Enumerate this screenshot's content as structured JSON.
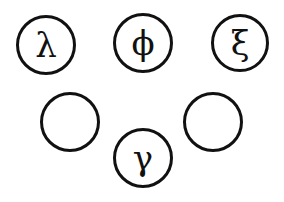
{
  "diagram": {
    "nodes": [
      {
        "id": "n1",
        "label": "λ",
        "cx": 46,
        "cy": 45,
        "r": 30
      },
      {
        "id": "n2",
        "label": "ϕ",
        "cx": 143,
        "cy": 43,
        "r": 30
      },
      {
        "id": "n3",
        "label": "ξ",
        "cx": 240,
        "cy": 43,
        "r": 29
      },
      {
        "id": "n4",
        "label": "",
        "cx": 70,
        "cy": 122,
        "r": 30
      },
      {
        "id": "n5",
        "label": "γ",
        "cx": 143,
        "cy": 158,
        "r": 30
      },
      {
        "id": "n6",
        "label": "",
        "cx": 213,
        "cy": 122,
        "r": 30
      }
    ],
    "stroke_color": "#111111",
    "background": "#ffffff"
  }
}
